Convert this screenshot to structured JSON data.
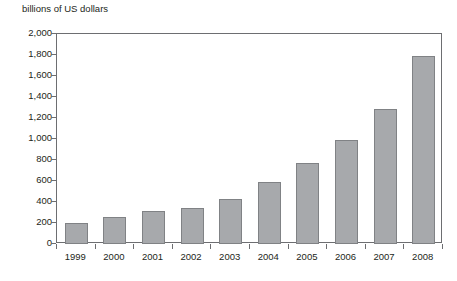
{
  "chart_data": {
    "type": "bar",
    "title": "billions of US dollars",
    "xlabel": "",
    "ylabel": "billions of US dollars",
    "categories": [
      "1999",
      "2000",
      "2001",
      "2002",
      "2003",
      "2004",
      "2005",
      "2006",
      "2007",
      "2008"
    ],
    "values": [
      200,
      260,
      310,
      345,
      430,
      595,
      770,
      990,
      1290,
      1790
    ],
    "ylim": [
      0,
      2000
    ],
    "ytick_labels": [
      "2,000",
      "1,800",
      "1,600",
      "1,400",
      "1,200",
      "1,000",
      "800",
      "600",
      "400",
      "200",
      "0"
    ],
    "ytick_values": [
      2000,
      1800,
      1600,
      1400,
      1200,
      1000,
      800,
      600,
      400,
      200,
      0
    ],
    "grid": false,
    "legend": "none",
    "bar_color": "#a7a9ac",
    "bar_border_color": "#808285",
    "axis_color": "#6d6e71",
    "text_color": "#231f20"
  }
}
